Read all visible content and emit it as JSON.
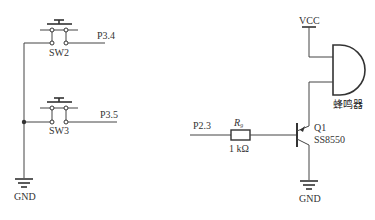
{
  "diagram": {
    "type": "circuit-schematic",
    "left_circuit": {
      "switches": [
        {
          "ref": "SW2",
          "net": "P3.4"
        },
        {
          "ref": "SW3",
          "net": "P3.5"
        }
      ],
      "ground_label": "GND"
    },
    "right_circuit": {
      "supply_label": "VCC",
      "buzzer_label": "蜂鸣器",
      "input_net": "P2.3",
      "resistor": {
        "ref": "R",
        "subscript": "9",
        "value": "1 kΩ"
      },
      "transistor": {
        "ref": "Q1",
        "part": "SS8550"
      },
      "ground_label": "GND"
    }
  },
  "colors": {
    "line": "#444444",
    "text": "#333333",
    "background": "#ffffff"
  }
}
